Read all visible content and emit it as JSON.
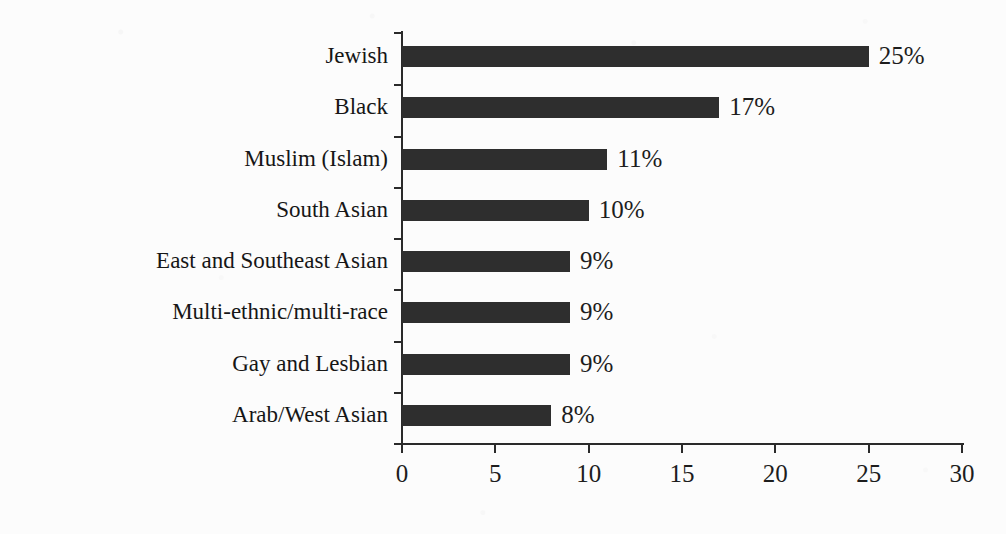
{
  "chart_data": {
    "type": "bar",
    "orientation": "horizontal",
    "title": "",
    "subtitle": "",
    "xlabel": "",
    "ylabel": "",
    "xlim": [
      0,
      30
    ],
    "xticks": [
      0,
      5,
      10,
      15,
      20,
      25,
      30
    ],
    "xtick_labels": [
      "0",
      "5",
      "10",
      "15",
      "20",
      "25",
      "30"
    ],
    "grid": false,
    "legend": false,
    "legend_position": "none",
    "categories": [
      "Jewish",
      "Black",
      "Muslim (Islam)",
      "South Asian",
      "East and Southeast Asian",
      "Multi-ethnic/multi-race",
      "Gay and Lesbian",
      "Arab/West Asian"
    ],
    "values": [
      25,
      17,
      11,
      10,
      9,
      9,
      9,
      8
    ],
    "data_labels": [
      "25%",
      "17%",
      "11%",
      "10%",
      "9%",
      "9%",
      "9%",
      "8%"
    ],
    "bar_color": "#2e2e2e",
    "axis_color": "#2a2a2a",
    "background_color": "#fcfcfc"
  },
  "axis": {
    "x_tick_labels": [
      "0",
      "5",
      "10",
      "15",
      "20",
      "25",
      "30"
    ]
  }
}
